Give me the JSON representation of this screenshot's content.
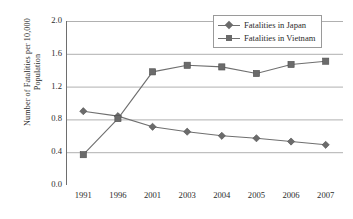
{
  "chart_data": {
    "type": "line",
    "title": "",
    "xlabel": "",
    "ylabel": "Number of Fatalities per 10,000 Population",
    "ylabel_line1": "Number of Fatalities per 10,000",
    "ylabel_line2": "Population",
    "categories": [
      "1991",
      "1996",
      "2001",
      "2003",
      "2004",
      "2005",
      "2006",
      "2007"
    ],
    "ylim": [
      0.0,
      2.0
    ],
    "ytick_labels": [
      "0.0",
      "0.4",
      "0.8",
      "1.2",
      "1.6",
      "2.0"
    ],
    "ytick_values": [
      0.0,
      0.4,
      0.8,
      1.2,
      1.6,
      2.0
    ],
    "grid": "horizontal",
    "legend_position": "top-right",
    "series": [
      {
        "name": "Fatalities in Japan",
        "marker": "diamond",
        "color": "#6b6b6b",
        "values": [
          0.9,
          0.84,
          0.71,
          0.65,
          0.6,
          0.57,
          0.53,
          0.49
        ]
      },
      {
        "name": "Fatalities in Vietnam",
        "marker": "square",
        "color": "#6b6b6b",
        "values": [
          0.37,
          0.81,
          1.38,
          1.46,
          1.44,
          1.36,
          1.47,
          1.51
        ]
      }
    ]
  },
  "legend": {
    "entries": [
      {
        "label": "Fatalities in Japan",
        "marker": "diamond"
      },
      {
        "label": "Fatalities in Vietnam",
        "marker": "square"
      }
    ]
  },
  "colors": {
    "series": "#6b6b6b",
    "line": "#6f6f6f",
    "grid": "#b0b0b0",
    "axis": "#7d7d7d",
    "text": "#2b2b2b",
    "background": "#ffffff"
  }
}
